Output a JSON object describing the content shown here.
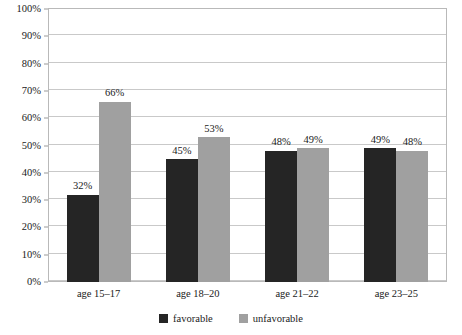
{
  "chart_data": {
    "type": "bar",
    "title": "",
    "subtitle": "",
    "xlabel": "",
    "ylabel": "",
    "ylim": [
      0,
      100
    ],
    "grid": true,
    "legend_position": "bottom",
    "categories": [
      "age 15–17",
      "age 18–20",
      "age 21–22",
      "age 23–25"
    ],
    "y_ticks": [
      "0%",
      "10%",
      "20%",
      "30%",
      "40%",
      "50%",
      "60%",
      "70%",
      "80%",
      "90%",
      "100%"
    ],
    "y_tick_values": [
      0,
      10,
      20,
      30,
      40,
      50,
      60,
      70,
      80,
      90,
      100
    ],
    "series": [
      {
        "name": "favorable",
        "color": "#252525",
        "values": [
          32,
          45,
          48,
          49
        ],
        "labels": [
          "32%",
          "45%",
          "48%",
          "49%"
        ]
      },
      {
        "name": "unfavorable",
        "color": "#a0a0a0",
        "values": [
          66,
          53,
          49,
          48
        ],
        "labels": [
          "66%",
          "53%",
          "49%",
          "48%"
        ]
      }
    ]
  },
  "legend": {
    "items": [
      {
        "label": "favorable",
        "color": "#252525"
      },
      {
        "label": "unfavorable",
        "color": "#a0a0a0"
      }
    ]
  },
  "colors": {
    "favorable": "#252525",
    "unfavorable": "#a0a0a0",
    "gridline": "#c9c9c9",
    "frame": "#b9b9b9",
    "text": "#1a1a1a",
    "background": "#ffffff"
  }
}
